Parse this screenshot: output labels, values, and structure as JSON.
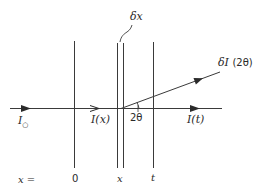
{
  "diagram": {
    "line_color": "#3a3a3a",
    "labels": {
      "incident": {
        "symbol": "I",
        "subscript": "○"
      },
      "intensity_x": "I(x)",
      "intensity_t": "I(t)",
      "scattered": "δI",
      "scattered_angle": "(2θ)",
      "slab_width": "δx",
      "angle": "2θ"
    },
    "axis": {
      "prefix": "x =",
      "ticks": [
        "0",
        "x",
        "t"
      ]
    }
  }
}
